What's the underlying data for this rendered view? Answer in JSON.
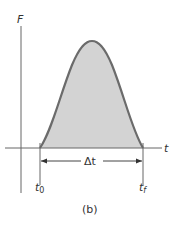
{
  "figure": {
    "y_axis_label": "F",
    "x_axis_label": "t",
    "interval_label": "Δt",
    "start_label": "t",
    "start_subscript": "0",
    "end_label": "t",
    "end_subscript": "f",
    "caption": "(b)"
  },
  "colors": {
    "curve": "#6b6b6b",
    "fill": "#d3d3d3",
    "axis": "#555555"
  }
}
